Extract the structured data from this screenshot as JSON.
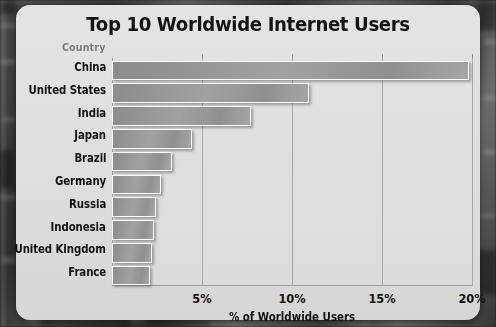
{
  "chart_data": {
    "type": "bar",
    "orientation": "horizontal",
    "title": "Top 10 Worldwide Internet Users",
    "xlabel": "% of Worldwide Users",
    "ylabel": "Country",
    "categories": [
      "China",
      "United States",
      "India",
      "Japan",
      "Brazil",
      "Germany",
      "Russia",
      "Indonesia",
      "United Kingdom",
      "France"
    ],
    "values": [
      19.9,
      11.0,
      7.8,
      4.5,
      3.4,
      2.8,
      2.5,
      2.4,
      2.3,
      2.2
    ],
    "xlim": [
      0,
      20
    ],
    "xticks": [
      5,
      10,
      15,
      20
    ],
    "xtick_labels": [
      "5%",
      "10%",
      "15%",
      "20%"
    ],
    "grid": true,
    "legend": "none",
    "bar_color": "#9a9a99",
    "bar_border_color": "#fbfbfb",
    "plot_background": "#dfdfdd",
    "card_background": "#e0e0de",
    "title_color": "#15120f",
    "axis_label_color": "#7c7c79"
  }
}
